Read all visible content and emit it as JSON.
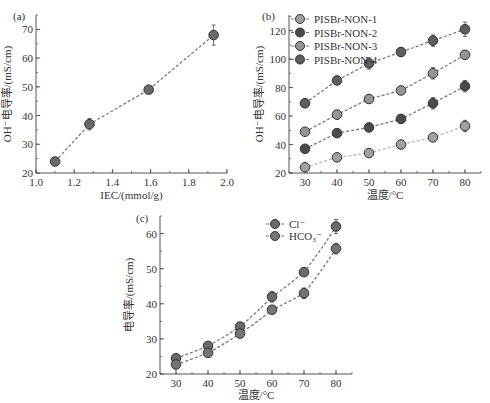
{
  "chart_data": [
    {
      "panel": "(a)",
      "type": "line",
      "xlabel": "IEC/(mmol/g)",
      "ylabel": "OH⁻电导率/(mS/cm)",
      "xlim": [
        1.0,
        2.0
      ],
      "ylim": [
        20,
        75
      ],
      "xticks": [
        "1.0",
        "1.2",
        "1.4",
        "1.6",
        "1.8",
        "2.0"
      ],
      "yticks": [
        "20",
        "30",
        "40",
        "50",
        "60",
        "70"
      ],
      "series": [
        {
          "name": "OH⁻ conductivity",
          "x": [
            1.1,
            1.28,
            1.59,
            1.93
          ],
          "values": [
            24,
            37,
            49,
            68
          ],
          "errors": [
            0.8,
            2,
            1,
            3.5
          ]
        }
      ],
      "grid": false
    },
    {
      "panel": "(b)",
      "type": "line",
      "xlabel": "温度/°C",
      "ylabel": "OH⁻电导率/(mS/cm)",
      "xlim": [
        25,
        85
      ],
      "ylim": [
        20,
        131
      ],
      "xticks": [
        "30",
        "40",
        "50",
        "60",
        "70",
        "80"
      ],
      "yticks": [
        "20",
        "40",
        "60",
        "80",
        "100",
        "120"
      ],
      "categories": [
        30,
        40,
        50,
        60,
        70,
        80
      ],
      "series": [
        {
          "name": "PISBr-NON-1",
          "values": [
            24,
            31,
            34,
            40,
            45,
            53
          ],
          "errors": [
            2,
            2,
            2,
            2,
            2,
            4
          ],
          "color": "#a0a0a0"
        },
        {
          "name": "PISBr-NON-2",
          "values": [
            37,
            48,
            52,
            58,
            69,
            81
          ],
          "errors": [
            2,
            2,
            2,
            2,
            4,
            4
          ],
          "color": "#4a4a4a"
        },
        {
          "name": "PISBr-NON-3",
          "values": [
            49,
            61,
            72,
            78,
            90,
            103
          ],
          "errors": [
            2,
            3,
            3,
            2,
            4,
            3
          ],
          "color": "#959595"
        },
        {
          "name": "PISBr-NON-4",
          "values": [
            69,
            85,
            97,
            105,
            113,
            121
          ],
          "errors": [
            3,
            2,
            4,
            3,
            4,
            5
          ],
          "color": "#5e5e5e"
        }
      ],
      "legend_position": "top-left",
      "grid": false
    },
    {
      "panel": "(c)",
      "type": "line",
      "xlabel": "温度/°C",
      "ylabel": "电导率/(mS/cm)",
      "xlim": [
        25,
        85
      ],
      "ylim": [
        20,
        65
      ],
      "xticks": [
        "30",
        "40",
        "50",
        "60",
        "70",
        "80"
      ],
      "yticks": [
        "20",
        "30",
        "40",
        "50",
        "60"
      ],
      "categories": [
        30,
        40,
        50,
        60,
        70,
        80
      ],
      "series": [
        {
          "name": "Cl⁻",
          "values": [
            24.5,
            28,
            33.5,
            42,
            49,
            62
          ],
          "errors": [
            0.6,
            0.6,
            0.6,
            1.5,
            0.8,
            2
          ],
          "color": "#6a6a6a"
        },
        {
          "name": "HCO₃⁻",
          "values": [
            22.7,
            26,
            31.5,
            38.3,
            43,
            55.7
          ],
          "errors": [
            0.6,
            0.6,
            0.6,
            0.8,
            1.5,
            1.5
          ],
          "color": "#747474"
        }
      ],
      "legend_position": "top-right",
      "grid": false
    }
  ],
  "labels": {
    "a": {
      "panel": "(a)",
      "xlabel": "IEC/(mmol/g)",
      "ylabel": "OH⁻电导率/(mS/cm)"
    },
    "b": {
      "panel": "(b)",
      "xlabel": "温度/°C",
      "ylabel": "OH⁻电导率/(mS/cm)"
    },
    "c": {
      "panel": "(c)",
      "xlabel": "温度/°C",
      "ylabel": "电导率/(mS/cm)"
    }
  }
}
